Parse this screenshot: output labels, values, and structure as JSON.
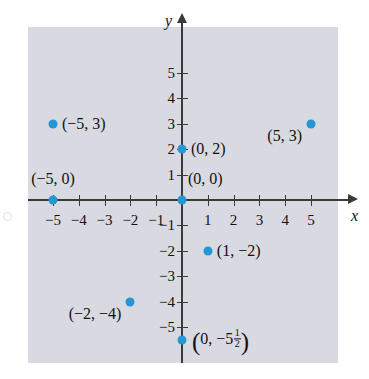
{
  "figure": {
    "type": "coordinate-plane-scatter",
    "axis_labels": {
      "x": "x",
      "y": "y"
    },
    "colors": {
      "point": "#2497d4",
      "axis": "#3a3a3a",
      "grid": "#dcdce4",
      "text": "#111111"
    },
    "x_axis": {
      "min": -5.8,
      "max": 6.2,
      "tick_values": [
        -5,
        -4,
        -3,
        -2,
        -1,
        1,
        2,
        3,
        4,
        5
      ],
      "tick_labels": [
        "−5",
        "−4",
        "−3",
        "−2",
        "−1",
        "1",
        "2",
        "3",
        "4",
        "5"
      ]
    },
    "y_axis": {
      "min": -6.3,
      "max": 7.0,
      "tick_values": [
        5,
        4,
        3,
        2,
        1,
        -1,
        -2,
        -3,
        -4,
        -5
      ],
      "tick_labels": [
        "5",
        "4",
        "3",
        "2",
        "1",
        "−1",
        "−2",
        "−3",
        "−4",
        "−5"
      ]
    },
    "points": [
      {
        "name": "point-neg5-3",
        "x": -5,
        "y": 3,
        "label": "(−5, 3)",
        "label_side": "right"
      },
      {
        "name": "point-5-3",
        "x": 5,
        "y": 3,
        "label": "(5, 3)",
        "label_side": "left"
      },
      {
        "name": "point-0-2",
        "x": 0,
        "y": 2,
        "label": "(0, 2)",
        "label_side": "right"
      },
      {
        "name": "point-neg5-0",
        "x": -5,
        "y": 0,
        "label": "(−5, 0)",
        "label_side": "above"
      },
      {
        "name": "point-0-0",
        "x": 0,
        "y": 0,
        "label": "(0, 0)",
        "label_side": "above-right"
      },
      {
        "name": "point-1-neg2",
        "x": 1,
        "y": -2,
        "label": "(1, −2)",
        "label_side": "right"
      },
      {
        "name": "point-neg2-neg4",
        "x": -2,
        "y": -4,
        "label": "(−2, −4)",
        "label_side": "left"
      },
      {
        "name": "point-0-neg5half",
        "x": 0,
        "y": -5.5,
        "label_prefix": "(0, −5",
        "label_frac_num": "1",
        "label_frac_den": "2",
        "label_suffix": ")",
        "label_side": "right"
      }
    ]
  },
  "chart_data": {
    "type": "scatter",
    "title": "",
    "xlabel": "x",
    "ylabel": "y",
    "xlim": [
      -5.8,
      6.2
    ],
    "ylim": [
      -6.3,
      7.0
    ],
    "grid": true,
    "legend": "none",
    "x": [
      -5,
      5,
      0,
      -5,
      0,
      1,
      -2,
      0
    ],
    "y": [
      3,
      3,
      2,
      0,
      0,
      -2,
      -4,
      -5.5
    ],
    "point_labels": [
      "(−5, 3)",
      "(5, 3)",
      "(0, 2)",
      "(−5, 0)",
      "(0, 0)",
      "(1, −2)",
      "(−2, −4)",
      "(0, −5 1/2)"
    ]
  }
}
